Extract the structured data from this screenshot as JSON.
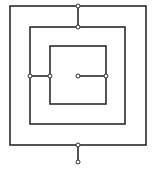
{
  "diagram": {
    "type": "square-spiral-coil",
    "loops": [
      "outer-loop",
      "middle-loop",
      "inner-loop"
    ],
    "terminals": [
      "center-terminal",
      "bottom-terminal"
    ],
    "connection_nodes": 6,
    "colors": {
      "line": "#2a2a2a",
      "background": "#ffffff"
    }
  }
}
